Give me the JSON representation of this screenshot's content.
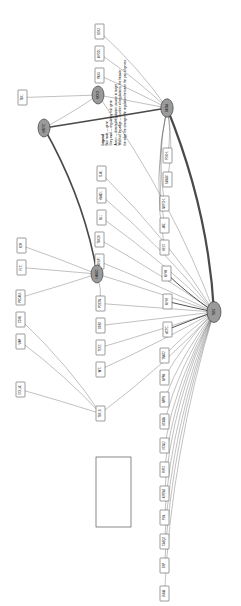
{
  "figure": {
    "orientation": "rotated-90",
    "background": "#ffffff",
    "edge_color": "#4a4a4a",
    "hub_fill": "#9a9a9a",
    "box_fill": "#ffffff",
    "box_stroke": "#4a4a4a"
  },
  "legend": {
    "title": "Legend",
    "lines": [
      "Box node  —  gene",
      "Grey oval  —  regulatory hub gene",
      "Arrow  —  directed regulation: source to target",
      "Width of the edge  —  number of regulations, the heavier",
      "the edge the stronger the regulation between the pair of genes"
    ]
  },
  "hubs": [
    {
      "id": "hub-main-right",
      "label": "TBX5",
      "cx": 214,
      "cy": 312,
      "rx": 7.0,
      "ry": 10.5
    },
    {
      "id": "hub-upper-right",
      "label": "GATA4",
      "cx": 167,
      "cy": 108,
      "rx": 6.2,
      "ry": 9.2
    },
    {
      "id": "hub-upper-mid",
      "label": "NKX25",
      "cx": 98,
      "cy": 95,
      "rx": 6.0,
      "ry": 9.0
    },
    {
      "id": "hub-left",
      "label": "MEF2C",
      "cx": 44,
      "cy": 128,
      "rx": 6.0,
      "ry": 9.0
    },
    {
      "id": "hub-mid-left",
      "label": "HAND2",
      "cx": 97,
      "cy": 274,
      "rx": 6.0,
      "ry": 9.0
    }
  ],
  "nodes": [
    {
      "id": "n01",
      "label": "SOX2",
      "x": 95,
      "y": 24
    },
    {
      "id": "n02",
      "label": "MYOD1",
      "x": 95,
      "y": 46
    },
    {
      "id": "n03",
      "label": "PAX3",
      "x": 95,
      "y": 68
    },
    {
      "id": "n04",
      "label": "TBX1",
      "x": 18,
      "y": 90
    },
    {
      "id": "n05",
      "label": "FOXH1",
      "x": 163,
      "y": 148
    },
    {
      "id": "n06",
      "label": "SMAD4",
      "x": 163,
      "y": 172
    },
    {
      "id": "n07",
      "label": "NOTCH1",
      "x": 160,
      "y": 196
    },
    {
      "id": "n08",
      "label": "JAG1",
      "x": 160,
      "y": 218
    },
    {
      "id": "n09",
      "label": "HEY2",
      "x": 160,
      "y": 240
    },
    {
      "id": "n10",
      "label": "MYH6",
      "x": 162,
      "y": 266
    },
    {
      "id": "n11",
      "label": "MYH7",
      "x": 163,
      "y": 294
    },
    {
      "id": "n12",
      "label": "ACTC1",
      "x": 163,
      "y": 322
    },
    {
      "id": "n13",
      "label": "TNNT2",
      "x": 160,
      "y": 348
    },
    {
      "id": "n14",
      "label": "NPPA",
      "x": 160,
      "y": 370
    },
    {
      "id": "n15",
      "label": "NPPB",
      "x": 160,
      "y": 392
    },
    {
      "id": "n16",
      "label": "GJA1",
      "x": 97,
      "y": 166
    },
    {
      "id": "n17",
      "label": "HAND1",
      "x": 97,
      "y": 188
    },
    {
      "id": "n18",
      "label": "ISL1",
      "x": 97,
      "y": 210
    },
    {
      "id": "n19",
      "label": "TBX20",
      "x": 95,
      "y": 232
    },
    {
      "id": "n20",
      "label": "MESP1",
      "x": 95,
      "y": 254
    },
    {
      "id": "n21",
      "label": "KDR",
      "x": 17,
      "y": 238
    },
    {
      "id": "n22",
      "label": "FLT1",
      "x": 17,
      "y": 260
    },
    {
      "id": "n23",
      "label": "PECAM1",
      "x": 16,
      "y": 290
    },
    {
      "id": "n24",
      "label": "CDH5",
      "x": 16,
      "y": 312
    },
    {
      "id": "n25",
      "label": "VWF",
      "x": 16,
      "y": 334
    },
    {
      "id": "n26",
      "label": "COL1A1",
      "x": 16,
      "y": 382
    },
    {
      "id": "n27",
      "label": "POSTN",
      "x": 96,
      "y": 296
    },
    {
      "id": "n28",
      "label": "DDR2",
      "x": 96,
      "y": 318
    },
    {
      "id": "n29",
      "label": "TCF21",
      "x": 96,
      "y": 340
    },
    {
      "id": "n30",
      "label": "WT1",
      "x": 96,
      "y": 362
    },
    {
      "id": "n31",
      "label": "TBX18",
      "x": 96,
      "y": 406
    },
    {
      "id": "n32",
      "label": "SCN5A",
      "x": 160,
      "y": 414
    },
    {
      "id": "n33",
      "label": "KCNJ2",
      "x": 160,
      "y": 438
    },
    {
      "id": "n34",
      "label": "RYR2",
      "x": 160,
      "y": 462
    },
    {
      "id": "n35",
      "label": "ATP2A2",
      "x": 160,
      "y": 486
    },
    {
      "id": "n36",
      "label": "PLN",
      "x": 160,
      "y": 510
    },
    {
      "id": "n37",
      "label": "CASQ2",
      "x": 160,
      "y": 534
    },
    {
      "id": "n38",
      "label": "DSP",
      "x": 160,
      "y": 558
    },
    {
      "id": "n39",
      "label": "LMNA",
      "x": 160,
      "y": 586
    }
  ],
  "edges": [
    {
      "from": "n01",
      "to": "hub-upper-right",
      "weight": 1
    },
    {
      "from": "n02",
      "to": "hub-upper-right",
      "weight": 1
    },
    {
      "from": "n03",
      "to": "hub-upper-right",
      "weight": 1
    },
    {
      "from": "n04",
      "to": "hub-upper-mid",
      "weight": 1
    },
    {
      "from": "hub-upper-mid",
      "to": "hub-upper-right",
      "weight": 1
    },
    {
      "from": "hub-left",
      "to": "hub-upper-mid",
      "weight": 1
    },
    {
      "from": "hub-left",
      "to": "hub-upper-right",
      "weight": 3
    },
    {
      "from": "hub-left",
      "to": "hub-mid-left",
      "weight": 3
    },
    {
      "from": "hub-upper-right",
      "to": "n05",
      "weight": 1
    },
    {
      "from": "hub-upper-right",
      "to": "n06",
      "weight": 1
    },
    {
      "from": "hub-upper-right",
      "to": "n07",
      "weight": 1
    },
    {
      "from": "hub-upper-right",
      "to": "n08",
      "weight": 1
    },
    {
      "from": "hub-upper-right",
      "to": "n09",
      "weight": 1
    },
    {
      "from": "hub-upper-right",
      "to": "hub-main-right",
      "weight": 4
    },
    {
      "from": "hub-upper-mid",
      "to": "hub-main-right",
      "weight": 1
    },
    {
      "from": "hub-main-right",
      "to": "n10",
      "weight": 2
    },
    {
      "from": "hub-main-right",
      "to": "n11",
      "weight": 2
    },
    {
      "from": "hub-main-right",
      "to": "n12",
      "weight": 2
    },
    {
      "from": "hub-main-right",
      "to": "n13",
      "weight": 1
    },
    {
      "from": "hub-main-right",
      "to": "n14",
      "weight": 1
    },
    {
      "from": "hub-main-right",
      "to": "n15",
      "weight": 1
    },
    {
      "from": "hub-main-right",
      "to": "n32",
      "weight": 1
    },
    {
      "from": "hub-main-right",
      "to": "n33",
      "weight": 1
    },
    {
      "from": "hub-main-right",
      "to": "n34",
      "weight": 1
    },
    {
      "from": "hub-main-right",
      "to": "n35",
      "weight": 1
    },
    {
      "from": "hub-main-right",
      "to": "n36",
      "weight": 1
    },
    {
      "from": "hub-main-right",
      "to": "n37",
      "weight": 1
    },
    {
      "from": "hub-main-right",
      "to": "n38",
      "weight": 1
    },
    {
      "from": "hub-main-right",
      "to": "n39",
      "weight": 1
    },
    {
      "from": "n16",
      "to": "hub-main-right",
      "weight": 1
    },
    {
      "from": "n17",
      "to": "hub-main-right",
      "weight": 1
    },
    {
      "from": "n18",
      "to": "hub-main-right",
      "weight": 1
    },
    {
      "from": "n19",
      "to": "hub-main-right",
      "weight": 1
    },
    {
      "from": "n20",
      "to": "hub-main-right",
      "weight": 1
    },
    {
      "from": "n27",
      "to": "hub-main-right",
      "weight": 1
    },
    {
      "from": "n28",
      "to": "hub-main-right",
      "weight": 1
    },
    {
      "from": "n29",
      "to": "hub-main-right",
      "weight": 1
    },
    {
      "from": "n30",
      "to": "hub-main-right",
      "weight": 1
    },
    {
      "from": "n21",
      "to": "hub-mid-left",
      "weight": 1
    },
    {
      "from": "n22",
      "to": "hub-mid-left",
      "weight": 1
    },
    {
      "from": "n23",
      "to": "hub-mid-left",
      "weight": 1
    },
    {
      "from": "n24",
      "to": "n31",
      "weight": 1
    },
    {
      "from": "n25",
      "to": "n31",
      "weight": 1
    },
    {
      "from": "n26",
      "to": "n31",
      "weight": 1
    },
    {
      "from": "hub-mid-left",
      "to": "hub-main-right",
      "weight": 1
    },
    {
      "from": "hub-mid-left",
      "to": "n27",
      "weight": 1
    },
    {
      "from": "n31",
      "to": "hub-main-right",
      "weight": 1
    }
  ]
}
